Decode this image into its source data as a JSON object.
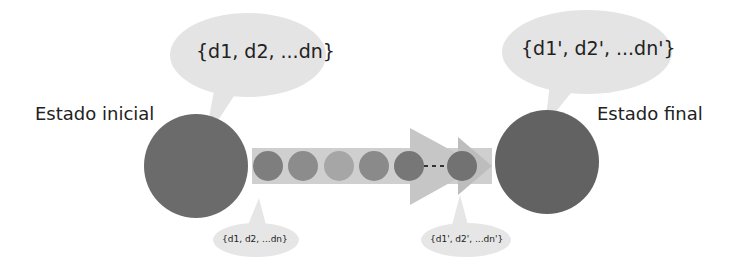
{
  "diagram": {
    "initial_state": {
      "label": "Estado inicial",
      "data_set": "{d1, d2, ...dn}"
    },
    "final_state": {
      "label": "Estado final",
      "data_set": "{d1', d2', ...dn'}"
    },
    "transition": {
      "start_data_set": "{d1, d2, ...dn}",
      "end_data_set": "{d1', d2', ...dn'}",
      "intermediate_steps": 6,
      "ellipsis": "- - - -"
    },
    "colors": {
      "state_circle": "#6b6b6b",
      "bubble": "#e4e4e4",
      "arrow": "#c9c9c9",
      "step_dark": "#7a7a7a",
      "step_mid": "#909090",
      "step_light": "#a8a8a8"
    }
  }
}
